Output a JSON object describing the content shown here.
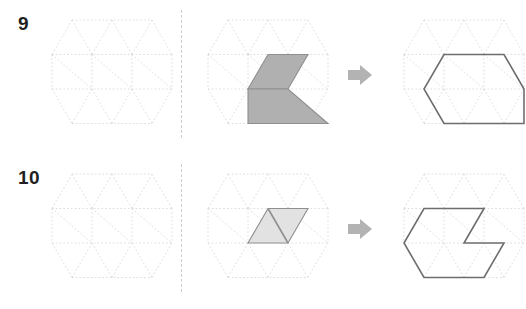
{
  "canvas": {
    "width": 526,
    "height": 309,
    "background": "#ffffff"
  },
  "style": {
    "grid_line_color": "#d8d8d8",
    "grid_dash": "1.6 2.2",
    "grid_stroke_width": 0.9,
    "divider_color": "#cfcfcf",
    "arrow_color": "#b3b3b3",
    "outline_color": "#6e6e6e",
    "outline_width": 1.6,
    "fill_dark": "#b0b0b0",
    "fill_light": "#e2e2e2",
    "number_color": "#231f20"
  },
  "icons": {
    "arrow_right": "arrow-right-icon"
  },
  "grid": {
    "description": "isometric triangular lattice, hexagon-trimmed",
    "columns": 3,
    "triangle_rows": 4,
    "cell_width": 40,
    "cell_height": 34.5,
    "origin_x": 12,
    "origin_y": 8
  },
  "problems": [
    {
      "id": "problem-9",
      "number": "9",
      "panels": {
        "left": {
          "name": "empty-grid",
          "shapes": []
        },
        "middle": {
          "name": "shaded-shape",
          "shapes": [
            {
              "name": "upper-parallelogram",
              "fill": "#b0b0b0",
              "stroke": "#8f8f8f",
              "points": "72,42.5 112,42.5 92,77 52,77"
            },
            {
              "name": "lower-trapezoid",
              "fill": "#b0b0b0",
              "stroke": "#8f8f8f",
              "points": "52,77 92,77 132,111.5 52,111.5"
            }
          ]
        },
        "right": {
          "name": "outlined-shape",
          "shapes": [
            {
              "name": "result-outline",
              "fill": "none",
              "stroke": "#6e6e6e",
              "points": "52,42.5 112,42.5 132,77 132,111.5 52,111.5 32,77"
            }
          ]
        }
      }
    },
    {
      "id": "problem-10",
      "number": "10",
      "panels": {
        "left": {
          "name": "empty-grid",
          "shapes": []
        },
        "middle": {
          "name": "shaded-shape",
          "shapes": [
            {
              "name": "rhombus",
              "fill": "#e2e2e2",
              "stroke": "#8f8f8f",
              "points": "72,42.5 112,42.5 92,77 52,77"
            },
            {
              "name": "rhombus-diagonal",
              "fill": "none",
              "stroke": "#8f8f8f",
              "points": "72,42.5 92,77"
            }
          ]
        },
        "right": {
          "name": "outlined-shape",
          "shapes": [
            {
              "name": "result-outline-notched",
              "fill": "none",
              "stroke": "#6e6e6e",
              "points": "32,42.5 92,42.5 72,77 112,77 92,111.5 32,111.5 12,77"
            }
          ]
        }
      }
    }
  ]
}
